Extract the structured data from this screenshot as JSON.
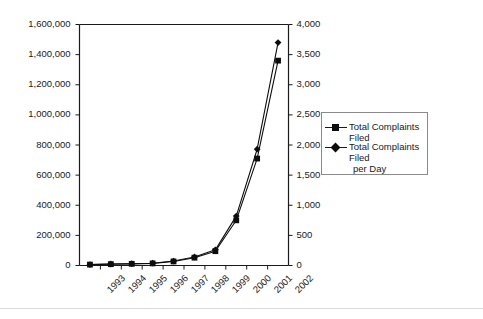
{
  "chart_data": {
    "type": "line",
    "title": "",
    "subtitle": "",
    "xlabel": "",
    "ylabel": "",
    "grid": false,
    "legend_position": "right",
    "categories": [
      "1993",
      "1994",
      "1995",
      "1996",
      "1997",
      "1998",
      "1999",
      "2000",
      "2001",
      "2002"
    ],
    "axes": {
      "left": {
        "label": "",
        "ylim": [
          0,
          1600000
        ],
        "tick_step": 200000,
        "tick_labels": [
          "0",
          "200,000",
          "400,000",
          "600,000",
          "800,000",
          "1,000,000",
          "1,200,000",
          "1,400,000",
          "1,600,000"
        ],
        "tick_values": [
          0,
          200000,
          400000,
          600000,
          800000,
          1000000,
          1200000,
          1400000,
          1600000
        ]
      },
      "right": {
        "label": "",
        "ylim": [
          0,
          4000
        ],
        "tick_step": 500,
        "tick_labels": [
          "0",
          "500",
          "1,000",
          "1,500",
          "2,000",
          "2,500",
          "3,000",
          "3,500",
          "4,000"
        ],
        "tick_values": [
          0,
          500,
          1000,
          1500,
          2000,
          2500,
          3000,
          3500,
          4000
        ]
      }
    },
    "series": [
      {
        "name": "Total Complaints Filed",
        "axis": "left",
        "marker": "square",
        "color": "#0d0d0d",
        "values": [
          6000,
          9000,
          11000,
          14000,
          27000,
          52000,
          95000,
          300000,
          710000,
          1360000
        ]
      },
      {
        "name": "Total Complaints Filed per Day",
        "axis": "right",
        "marker": "diamond",
        "color": "#0d0d0d",
        "values": [
          16,
          25,
          30,
          38,
          74,
          142,
          260,
          820,
          1930,
          3700
        ]
      }
    ]
  },
  "legend": {
    "entries": [
      {
        "label": "Total Complaints Filed",
        "label_line2": ""
      },
      {
        "label": "Total Complaints Filed",
        "label_line2": "per Day"
      }
    ]
  }
}
